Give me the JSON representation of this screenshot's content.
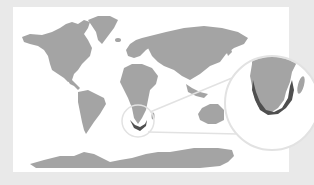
{
  "map": {
    "type": "world-map-locator",
    "highlight_region": "southern-africa-coast",
    "has_text": false,
    "colors": {
      "background_frame": "#e9e9e9",
      "panel": "#ffffff",
      "land": "#a4a4a4",
      "highlight": "#4f4f4f",
      "callout_ring": "#e4e4e4"
    },
    "callout": {
      "source_circle": {
        "cx": 138,
        "cy": 121,
        "r": 16
      },
      "magnified_circle": {
        "cx": 272,
        "cy": 103,
        "r": 47
      }
    }
  }
}
